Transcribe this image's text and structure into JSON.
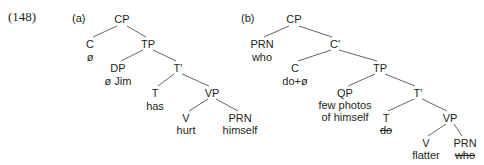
{
  "example_number": "(148)",
  "trees": [
    {
      "label": "(a)",
      "nodes": {
        "cp": {
          "cat": "CP"
        },
        "c": {
          "cat": "C",
          "word": "ø"
        },
        "tp": {
          "cat": "TP"
        },
        "dp": {
          "cat": "DP",
          "word": "ø Jim"
        },
        "tbar": {
          "cat": "T'"
        },
        "t": {
          "cat": "T",
          "word": "has"
        },
        "vp": {
          "cat": "VP"
        },
        "v": {
          "cat": "V",
          "word": "hurt"
        },
        "prn": {
          "cat": "PRN",
          "word": "himself"
        }
      }
    },
    {
      "label": "(b)",
      "nodes": {
        "cp": {
          "cat": "CP"
        },
        "prn": {
          "cat": "PRN",
          "word": "who"
        },
        "cbar": {
          "cat": "C'"
        },
        "c": {
          "cat": "C",
          "word": "do+ø"
        },
        "tp": {
          "cat": "TP"
        },
        "qp": {
          "cat": "QP",
          "word1": "few photos",
          "word2": "of himself"
        },
        "tbar": {
          "cat": "T'"
        },
        "t": {
          "cat": "T",
          "word": "do",
          "struck": true
        },
        "vp": {
          "cat": "VP"
        },
        "v": {
          "cat": "V",
          "word": "flatter"
        },
        "prn2": {
          "cat": "PRN",
          "word": "who",
          "struck": true
        }
      }
    }
  ],
  "colors": {
    "ink": "#231f20",
    "line": "#4d4d4d"
  }
}
